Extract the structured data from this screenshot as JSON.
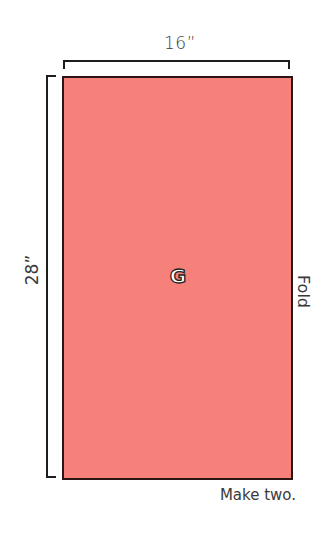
{
  "diagram": {
    "piece": {
      "letter": "G",
      "fill_color": "#F5817A",
      "outline_color": "#2A1414"
    },
    "dimensions": {
      "width": "16”",
      "height": "28”"
    },
    "edge_label": "Fold",
    "instructions": "Make two."
  }
}
